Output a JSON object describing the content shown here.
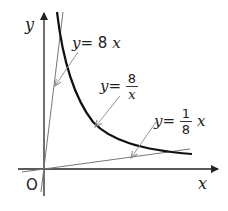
{
  "diagram": {
    "axes": {
      "x_label": "x",
      "y_label": "y",
      "origin_label": "O"
    },
    "curves": [
      {
        "id": "line-8x",
        "label_lhs": "y",
        "label_eq": "=",
        "label_rhs": "8",
        "label_var": "x",
        "style": "thin"
      },
      {
        "id": "hyperbola",
        "label_lhs": "y",
        "label_eq": "=",
        "numerator": "8",
        "denominator": "x",
        "style": "thick"
      },
      {
        "id": "line-x-over-8",
        "label_lhs": "y",
        "label_eq": "=",
        "numerator": "1",
        "denominator": "8",
        "label_var": "x",
        "style": "thin"
      }
    ],
    "colors": {
      "axis": "#222222",
      "curve": "#111111",
      "thin_line": "#777777",
      "pointer": "#888888"
    }
  }
}
